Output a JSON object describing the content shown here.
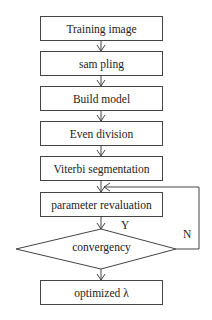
{
  "flowchart": {
    "steps": [
      {
        "id": "training-image",
        "label": "Training image"
      },
      {
        "id": "sampling",
        "label": "sam pling"
      },
      {
        "id": "build-model",
        "label": "Build model"
      },
      {
        "id": "even-division",
        "label": "Even division"
      },
      {
        "id": "viterbi-segmentation",
        "label": "Viterbi segmentation"
      },
      {
        "id": "parameter-revaluation",
        "label": "parameter revaluation"
      }
    ],
    "decision": {
      "label": "convergency",
      "yes_label": "Y",
      "no_label": "N"
    },
    "end": {
      "label": "optimized λ"
    }
  },
  "colors": {
    "stroke": "#444444",
    "background": "#ffffff",
    "text": "#222222"
  }
}
